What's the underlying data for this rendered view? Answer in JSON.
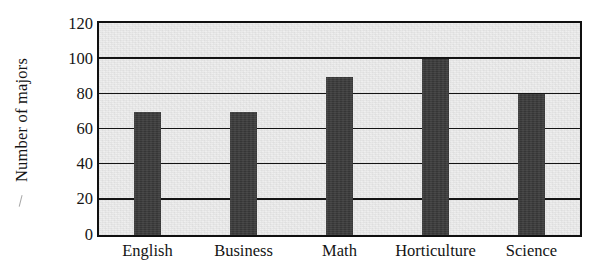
{
  "chart_data": {
    "type": "bar",
    "title": "",
    "xlabel": "",
    "ylabel": "Number of majors",
    "categories": [
      "English",
      "Business",
      "Math",
      "Horticulture",
      "Science"
    ],
    "values": [
      70,
      70,
      90,
      100,
      80
    ],
    "ylim": [
      0,
      120
    ],
    "ytick_step": 20,
    "yticks": [
      0,
      20,
      40,
      60,
      80,
      100,
      120
    ],
    "ytick_labels": [
      "0",
      "20",
      "40",
      "60",
      "80",
      "100",
      "120"
    ],
    "grid": true,
    "grid_axis": "y",
    "legend": false,
    "legend_position": "none",
    "series": [
      {
        "name": "Number of majors",
        "values": [
          70,
          70,
          90,
          100,
          80
        ]
      }
    ]
  },
  "style": {
    "bar_color": "#3b3b3b",
    "plot_background": "#ededed",
    "page_background": "#ffffff",
    "axis_color": "#101010",
    "grid_color": "#141414",
    "text_color": "#141414"
  }
}
